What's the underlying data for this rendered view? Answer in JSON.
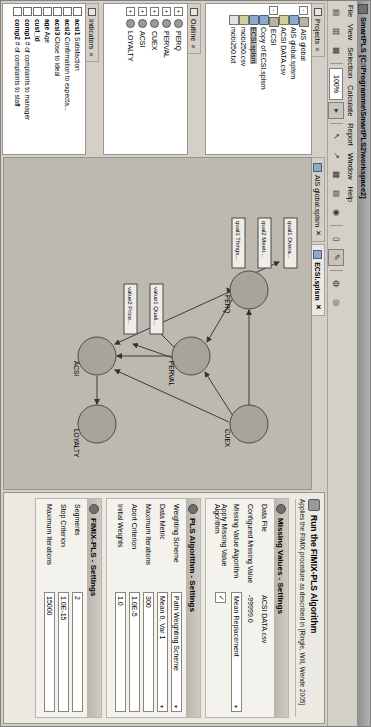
{
  "window": {
    "title": "SmartPLS [C:\\Programme\\SmartPLS2\\workspace2]",
    "icon": "app-icon"
  },
  "menu": {
    "items": [
      "File",
      "View",
      "Selection",
      "Calculate",
      "Report",
      "Window",
      "Help"
    ]
  },
  "toolbar": {
    "zoom_level": "100%",
    "buttons": [
      {
        "name": "new-icon",
        "glyph": "▤"
      },
      {
        "name": "open-icon",
        "glyph": "▥"
      },
      {
        "name": "save-icon",
        "glyph": "▦"
      },
      {
        "name": "zoom-out-icon",
        "glyph": "▾"
      },
      {
        "name": "zoom-in-icon",
        "glyph": "▸"
      },
      {
        "name": "select-tool-icon",
        "glyph": "↖"
      },
      {
        "name": "connect-tool-icon",
        "glyph": "↗"
      },
      {
        "name": "table-icon",
        "glyph": "▩"
      },
      {
        "name": "grid-icon",
        "glyph": "▤"
      },
      {
        "name": "calculate-icon",
        "glyph": "◉"
      },
      {
        "name": "report-icon",
        "glyph": "▯"
      },
      {
        "name": "highlight-icon",
        "glyph": "✎"
      },
      {
        "name": "node-icon",
        "glyph": "◍"
      },
      {
        "name": "cluster-icon",
        "glyph": "◎"
      }
    ]
  },
  "projects_panel": {
    "tab_label": "Projects",
    "tab_close": "✕",
    "tree": [
      {
        "label": "AIS global",
        "icon": "project-folder-icon",
        "level": 0,
        "expander": "-",
        "selected": false
      },
      {
        "label": "AIS global.splsm",
        "icon": "model-icon",
        "level": 1,
        "expander": "",
        "selected": false
      },
      {
        "label": "ACSI DATA.csv",
        "icon": "csv-icon",
        "level": 1,
        "expander": "",
        "selected": false
      },
      {
        "label": "ECSI",
        "icon": "project-folder-icon",
        "level": 0,
        "expander": "-",
        "selected": false
      },
      {
        "label": "Copy of ECSI.splsm",
        "icon": "model-icon",
        "level": 1,
        "expander": "",
        "selected": false
      },
      {
        "label": "ECSI.splsm",
        "icon": "model-icon",
        "level": 1,
        "expander": "",
        "selected": true
      },
      {
        "label": "mobi250.csv",
        "icon": "csv-icon",
        "level": 1,
        "expander": "",
        "selected": false
      },
      {
        "label": "mobi250.txt",
        "icon": "txt-icon",
        "level": 1,
        "expander": "",
        "selected": false
      }
    ]
  },
  "outline_panel": {
    "tab_label": "Outline",
    "tab_close": "✕",
    "items": [
      {
        "label": "PERQ",
        "expander": "+"
      },
      {
        "label": "PERVAL",
        "expander": "+"
      },
      {
        "label": "CUEX",
        "expander": "+"
      },
      {
        "label": "ACSI",
        "expander": "+"
      },
      {
        "label": "LOYALTY",
        "expander": "+"
      }
    ]
  },
  "indicators_panel": {
    "tab_label": "Indicators",
    "tab_close": "✕",
    "items": [
      {
        "name": "acsi1",
        "desc": "Satisfaction",
        "checked": false
      },
      {
        "name": "acsi2",
        "desc": "Confirmation to expecta...",
        "checked": false
      },
      {
        "name": "acsi3",
        "desc": "Close to ideal",
        "checked": false
      },
      {
        "name": "age",
        "desc": "Age",
        "checked": false
      },
      {
        "name": "cust_id",
        "desc": "",
        "checked": false
      },
      {
        "name": "comp1",
        "desc": "# of complaints to manager",
        "checked": false
      },
      {
        "name": "comp2",
        "desc": "# of complaints to staff",
        "checked": false
      }
    ]
  },
  "editor": {
    "tabs": [
      {
        "label": "AIS global.splsm",
        "active": false,
        "close": "✕"
      },
      {
        "label": "ECSI.splsm",
        "active": true,
        "close": "✕"
      }
    ]
  },
  "model": {
    "constructs": [
      {
        "id": "PERQ",
        "label": "PERQ",
        "cx": 132,
        "cy": 62
      },
      {
        "id": "PERVAL",
        "label": "PERVAL",
        "cx": 198,
        "cy": 120
      },
      {
        "id": "ACSI",
        "label": "ACSI",
        "cx": 198,
        "cy": 214
      },
      {
        "id": "CUEX",
        "label": "CUEX",
        "cx": 266,
        "cy": 62
      },
      {
        "id": "LOYALTY",
        "label": "LOYALTY",
        "cx": 266,
        "cy": 214
      }
    ],
    "indicators": [
      {
        "label": "qual1 Overa...",
        "x": 84,
        "y": 20
      },
      {
        "label": "qual2 Meeti...",
        "x": 84,
        "y": 46
      },
      {
        "label": "qual3 Things...",
        "x": 84,
        "y": 72
      },
      {
        "label": "value1 Quali...",
        "x": 146,
        "y": 150
      },
      {
        "label": "value2 Price...",
        "x": 146,
        "y": 176
      }
    ],
    "paths": [
      {
        "from": "CUEX",
        "to": "PERQ"
      },
      {
        "from": "PERQ",
        "to": "PERVAL"
      },
      {
        "from": "CUEX",
        "to": "PERVAL"
      },
      {
        "from": "PERQ",
        "to": "ACSI"
      },
      {
        "from": "PERVAL",
        "to": "ACSI"
      },
      {
        "from": "CUEX",
        "to": "ACSI"
      },
      {
        "from": "ACSI",
        "to": "LOYALTY"
      }
    ]
  },
  "settings": {
    "header_title": "Run the FIMIX-PLS Algorithm",
    "header_sub": "Applies the FIMIX procedure as described in [Ringle, Will, Wende 2005]",
    "groups": [
      {
        "title": "Missing Values - Settings",
        "icon": "missing-values-icon",
        "fields": [
          {
            "kind": "text",
            "label": "Data File",
            "value": "ACSI DATA.csv"
          },
          {
            "kind": "text",
            "label": "Configured Missing Value",
            "value": "-99999.0"
          },
          {
            "kind": "combo",
            "label": "Missing Value Algorithm",
            "value": "Mean Replacement"
          },
          {
            "kind": "checkbox",
            "label": "Apply Missing Value Algorithm",
            "value": "✓"
          }
        ]
      },
      {
        "title": "PLS Algorithm - Settings",
        "icon": "pls-algorithm-icon",
        "fields": [
          {
            "kind": "combo",
            "label": "Weighting Scheme",
            "value": "Path Weighting Scheme"
          },
          {
            "kind": "combo",
            "label": "Data Metric",
            "value": "Mean 0, Var 1"
          },
          {
            "kind": "text",
            "label": "Maximum Iterations",
            "value": "300"
          },
          {
            "kind": "text",
            "label": "Abort Criterion",
            "value": "1.0E-5"
          },
          {
            "kind": "text",
            "label": "Initial Weights",
            "value": "1.0"
          }
        ]
      },
      {
        "title": "FIMIX-PLS - Settings",
        "icon": "fimix-pls-icon",
        "fields": [
          {
            "kind": "text",
            "label": "Segments",
            "value": "2"
          },
          {
            "kind": "text",
            "label": "Stop Criterion",
            "value": "1.0E-15"
          },
          {
            "kind": "text",
            "label": "Maximum Iterations",
            "value": "15000"
          }
        ]
      }
    ]
  }
}
